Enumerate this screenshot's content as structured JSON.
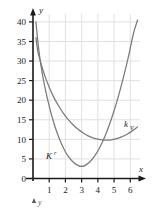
{
  "figure": {
    "background_color": "#ffffff",
    "axis_color": "#1a1a1a",
    "grid_color": "#d8d8e0",
    "curve_color": "#7a7a7a"
  },
  "axes": {
    "x_axis_label": "x",
    "y_axis_label": "y",
    "x_ticks": [
      "1",
      "2",
      "3",
      "4",
      "5",
      "6"
    ],
    "y_ticks": [
      "0",
      "5",
      "10",
      "15",
      "20",
      "25",
      "30",
      "35",
      "40"
    ],
    "origin_label": "0"
  },
  "annotations": {
    "curve1_label": "K",
    "curve1_label_sub": "r",
    "curve2_label": "k",
    "curve2_label_sub": "V",
    "stray_y_glyph": "y"
  },
  "chart_data": {
    "type": "line",
    "title": "",
    "xlabel": "x",
    "ylabel": "y",
    "xlim": [
      0,
      6.6
    ],
    "ylim": [
      0,
      41
    ],
    "x_ticks": [
      1,
      2,
      3,
      4,
      5,
      6
    ],
    "y_ticks": [
      0,
      5,
      10,
      15,
      20,
      25,
      30,
      35,
      40
    ],
    "grid": true,
    "legend": "inline-curve-labels",
    "series": [
      {
        "name": "K_r",
        "label": "K r",
        "description": "Steep upward parabola with minimum near x=3, y=3",
        "points": [
          [
            0.18,
            40.0
          ],
          [
            0.3,
            35.0
          ],
          [
            0.45,
            30.0
          ],
          [
            0.7,
            24.0
          ],
          [
            1.0,
            18.5
          ],
          [
            1.3,
            14.0
          ],
          [
            1.6,
            10.4
          ],
          [
            1.9,
            7.6
          ],
          [
            2.2,
            5.5
          ],
          [
            2.5,
            4.1
          ],
          [
            2.8,
            3.3
          ],
          [
            3.0,
            3.1
          ],
          [
            3.2,
            3.3
          ],
          [
            3.5,
            4.2
          ],
          [
            3.8,
            5.7
          ],
          [
            4.1,
            7.8
          ],
          [
            4.4,
            10.4
          ],
          [
            4.7,
            13.6
          ],
          [
            5.0,
            17.3
          ],
          [
            5.3,
            21.5
          ],
          [
            5.6,
            26.2
          ],
          [
            5.9,
            31.4
          ],
          [
            6.2,
            37.1
          ],
          [
            6.45,
            40.5
          ]
        ]
      },
      {
        "name": "k_V",
        "label": "k V",
        "description": "Shallow curve decreasing from 30 to a flat minimum near x=4.5, y=9.8, then rising slightly",
        "points": [
          [
            0.18,
            36.0
          ],
          [
            0.3,
            32.5
          ],
          [
            0.45,
            30.0
          ],
          [
            0.7,
            26.6
          ],
          [
            1.0,
            23.3
          ],
          [
            1.3,
            20.6
          ],
          [
            1.6,
            18.4
          ],
          [
            1.9,
            16.5
          ],
          [
            2.2,
            14.9
          ],
          [
            2.5,
            13.6
          ],
          [
            2.8,
            12.5
          ],
          [
            3.1,
            11.6
          ],
          [
            3.4,
            10.9
          ],
          [
            3.7,
            10.4
          ],
          [
            4.0,
            10.05
          ],
          [
            4.3,
            9.85
          ],
          [
            4.6,
            9.8
          ],
          [
            4.9,
            9.95
          ],
          [
            5.2,
            10.25
          ],
          [
            5.5,
            10.7
          ],
          [
            5.8,
            11.3
          ],
          [
            6.1,
            12.1
          ],
          [
            6.45,
            13.2
          ]
        ]
      }
    ],
    "intersection": [
      4.55,
      10.0
    ],
    "minima": {
      "K_r": [
        3.0,
        3.1
      ],
      "k_V": [
        4.6,
        9.8
      ]
    }
  }
}
